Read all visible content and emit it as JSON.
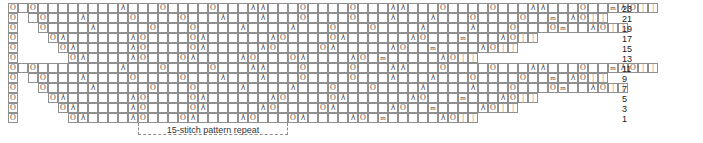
{
  "chart": {
    "type": "knitting-chart",
    "cell_width": 10,
    "cell_height": 10,
    "origin_x": 8,
    "origin_y": 3,
    "total_columns": 61,
    "total_rows": 12,
    "grid_color": "#8f8f8f",
    "symbol_color": "#555555",
    "symbols": {
      "o": "O",
      "lam": "λ",
      "k": "|",
      "m": "m",
      "blank": ""
    },
    "symbol_names": {
      "o": "yarn-over",
      "lam": "decrease",
      "k": "knit",
      "m": "make-one"
    },
    "row_numbers": [
      23,
      21,
      19,
      17,
      15,
      13,
      11,
      9,
      7,
      5,
      3,
      1
    ],
    "rows": [
      {
        "number": 23,
        "start_col": 0,
        "end_col": 61,
        "cells": "_O________λ___O____O___λλ___O____O___λλ___O____O___λλ___O__mλO||"
      },
      {
        "number": 21,
        "start_col": 1,
        "end_col": 61,
        "cells": "_O___λ____O____O___λ___λ___O____O___λ___λ___O____O__m_λO||"
      },
      {
        "number": 19,
        "start_col": 2,
        "end_col": 61,
        "cells": "O____λ_____O___O____λ____λ___O___O____λ____λ___O___Om__λO||"
      },
      {
        "number": 17,
        "start_col": 3,
        "end_col": 61,
        "cells": "Oλ______λO____Oλ______λO____Oλ______λO___m___λO||"
      },
      {
        "number": 15,
        "start_col": 4,
        "end_col": 61,
        "cells": "Oλ_____λO____Oλ_____λO____Oλ_____λO__m____λO||"
      },
      {
        "number": 13,
        "start_col": 5,
        "end_col": 61,
        "cells": "Oλ____λO___Oλ____λO___Oλ____λO_m_____λO||"
      },
      {
        "number": 11,
        "start_col": 0,
        "end_col": 61,
        "cells": "_O________λ___O____O___λλ___O____O___λλ___O____O___λλ___O__mλO||"
      },
      {
        "number": 9,
        "start_col": 1,
        "end_col": 61,
        "cells": "_O___λ____O____O___λ___λ___O____O___λ___λ___O____O__m_λO||"
      },
      {
        "number": 7,
        "start_col": 2,
        "end_col": 61,
        "cells": "O____λ_____O___O____λ____λ___O___O____λ____λ___O___Om__λO||"
      },
      {
        "number": 5,
        "start_col": 3,
        "end_col": 61,
        "cells": "Oλ______λO____Oλ______λO____Oλ______λO___m___λO||"
      },
      {
        "number": 3,
        "start_col": 4,
        "end_col": 61,
        "cells": "Oλ_____λO____Oλ_____λO____Oλ_____λO__m____λO||"
      },
      {
        "number": 1,
        "start_col": 5,
        "end_col": 61,
        "cells": "Oλ____λO___Oλ____λO___Oλ____λO_m_____λO||"
      }
    ],
    "edge_column": {
      "label": "O",
      "symbol": "o",
      "rows": 12
    },
    "repeat": {
      "label": "15-stitch pattern repeat",
      "stitches": 15,
      "start_col": 13,
      "end_col": 28,
      "guide_line_cols": [
        13,
        28
      ]
    }
  }
}
